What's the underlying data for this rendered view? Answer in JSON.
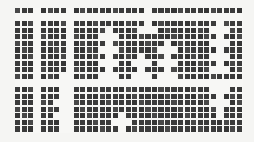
{
  "figure": {
    "name": "grid-matrix-visualization",
    "type": "binary-matrix",
    "background_color": "#f5f5f3",
    "plot_background_color": "#f7f7f5",
    "cell_color": "#3b3b3b",
    "gap_color": "#f7f7f5",
    "plot_x": 15,
    "plot_y": 8,
    "plot_width": 228,
    "plot_height": 125,
    "cols": 35,
    "rows": 19,
    "cell_pitch_x": 6.52,
    "cell_pitch_y": 6.58,
    "cell_gap": 1.4
  },
  "chart_data": {
    "type": "heatmap",
    "title": "",
    "xlabel": "",
    "ylabel": "",
    "cols": 35,
    "rows": 19,
    "legend": [],
    "grid": true,
    "note": "Dark squares = filled cells; white gaps = empty rows/columns forming plus/cross motifs",
    "empty_rows": [
      1,
      11
    ],
    "empty_cols": [
      3,
      8
    ],
    "cross_marks": [
      {
        "name": "cross-top-center",
        "col": 20,
        "row_start": 0,
        "row_end": 2,
        "col_span": 3,
        "row": 1
      },
      {
        "name": "cross-upper-center",
        "col": 20,
        "row": 3,
        "col_span": 3
      },
      {
        "name": "vline-center-left",
        "col": 14,
        "row_start": 3,
        "row_end": 10
      },
      {
        "name": "vline-center-right",
        "col": 23,
        "row_start": 5,
        "row_end": 10
      },
      {
        "name": "vline-mid",
        "col": 19,
        "row_start": 7,
        "row_end": 11
      },
      {
        "name": "vline-right",
        "col": 31,
        "row_start": 2,
        "row_end": 9
      },
      {
        "name": "vline-lower-right",
        "col": 31,
        "row_start": 11,
        "row_end": 16
      },
      {
        "name": "vline-lower-left",
        "col": 7,
        "row_start": 10,
        "row_end": 18
      },
      {
        "name": "vline-bottom-center",
        "col": 16,
        "row_start": 16,
        "row_end": 18
      }
    ],
    "h_ticks": [
      {
        "col": 20,
        "row": 1
      },
      {
        "col": 20,
        "row": 3
      },
      {
        "col": 14,
        "row": 4
      },
      {
        "col": 14,
        "row": 6
      },
      {
        "col": 14,
        "row": 8
      },
      {
        "col": 14,
        "row": 10
      },
      {
        "col": 23,
        "row": 6
      },
      {
        "col": 23,
        "row": 8
      },
      {
        "col": 23,
        "row": 10
      },
      {
        "col": 19,
        "row": 8
      },
      {
        "col": 19,
        "row": 10
      },
      {
        "col": 31,
        "row": 3
      },
      {
        "col": 31,
        "row": 5
      },
      {
        "col": 31,
        "row": 7
      },
      {
        "col": 31,
        "row": 9
      },
      {
        "col": 31,
        "row": 12
      },
      {
        "col": 31,
        "row": 14
      },
      {
        "col": 7,
        "row": 11
      },
      {
        "col": 7,
        "row": 14
      },
      {
        "col": 7,
        "row": 16
      },
      {
        "col": 16,
        "row": 17
      }
    ]
  }
}
